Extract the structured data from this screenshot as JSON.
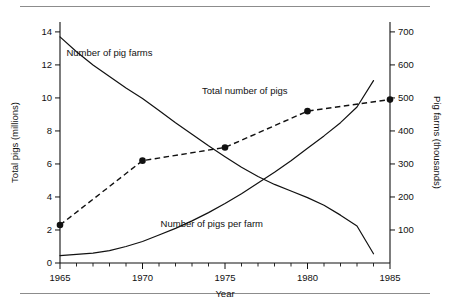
{
  "figure": {
    "background": "#ffffff",
    "ink_color": "#111111",
    "rule_color": "#8c8c8c"
  },
  "chart_data": {
    "type": "line",
    "title": "",
    "xlabel": "Year",
    "ylabel": "Total pigs (millions)",
    "y2label": "Pig farms (thousands)",
    "xlim": [
      1965,
      1985
    ],
    "ylim": [
      0,
      14.6
    ],
    "y2lim": [
      0,
      730
    ],
    "grid": false,
    "legend": "inline-annotations",
    "xticks": [
      1965,
      1970,
      1975,
      1980,
      1985
    ],
    "xtick_labels": [
      "1965",
      "1970",
      "1975",
      "1980",
      "1985"
    ],
    "xminor_ticks": [
      1966,
      1967,
      1968,
      1969,
      1971,
      1972,
      1973,
      1974,
      1976,
      1977,
      1978,
      1979,
      1981,
      1982,
      1983,
      1984
    ],
    "yticks": [
      0,
      2,
      4,
      6,
      8,
      10,
      12,
      14
    ],
    "ytick_labels": [
      "0",
      "2",
      "4",
      "6",
      "8",
      "10",
      "12",
      "14"
    ],
    "y2ticks": [
      100,
      200,
      300,
      400,
      500,
      600,
      700
    ],
    "y2tick_labels": [
      "100",
      "200",
      "300",
      "400",
      "500",
      "600",
      "700"
    ],
    "series": [
      {
        "name": "Total number of pigs",
        "axis": "left",
        "unit": "millions",
        "style": "dashed-with-markers",
        "markers": true,
        "x": [
          1965,
          1970,
          1975,
          1980,
          1985
        ],
        "values": [
          2.3,
          6.2,
          7.0,
          9.2,
          9.9
        ],
        "label": "Total number of pigs",
        "label_x": 1976.2,
        "label_y": 10.25
      },
      {
        "name": "Number of pig farms",
        "axis": "right",
        "unit": "thousands",
        "style": "solid",
        "markers": false,
        "x": [
          1965,
          1966,
          1967,
          1968,
          1969,
          1970,
          1971,
          1972,
          1973,
          1974,
          1975,
          1976,
          1977,
          1978,
          1979,
          1980,
          1981,
          1982,
          1983,
          1984
        ],
        "values": [
          685,
          640,
          600,
          565,
          530,
          498,
          462,
          425,
          390,
          355,
          322,
          290,
          262,
          238,
          218,
          198,
          175,
          145,
          112,
          28
        ],
        "values_left_scale": [
          13.7,
          12.8,
          12.0,
          11.3,
          10.6,
          9.95,
          9.25,
          8.5,
          7.8,
          7.1,
          6.45,
          5.8,
          5.25,
          4.75,
          4.35,
          3.95,
          3.5,
          2.9,
          2.25,
          0.55
        ],
        "label": "Number of pig farms",
        "label_x": 1968.0,
        "label_y": 12.55
      },
      {
        "name": "Number of pigs per farm",
        "axis": "left-indicative",
        "unit": "pigs per farm",
        "style": "solid",
        "markers": false,
        "x": [
          1965,
          1966,
          1967,
          1968,
          1969,
          1970,
          1971,
          1972,
          1973,
          1974,
          1975,
          1976,
          1977,
          1978,
          1979,
          1980,
          1981,
          1982,
          1983,
          1984
        ],
        "values": [
          0.45,
          0.52,
          0.6,
          0.75,
          1.0,
          1.3,
          1.7,
          2.1,
          2.55,
          3.05,
          3.6,
          4.2,
          4.85,
          5.5,
          6.2,
          6.95,
          7.7,
          8.5,
          9.45,
          11.05
        ],
        "label": "Number of pigs per farm",
        "label_x": 1974.2,
        "label_y": 2.2
      }
    ]
  }
}
